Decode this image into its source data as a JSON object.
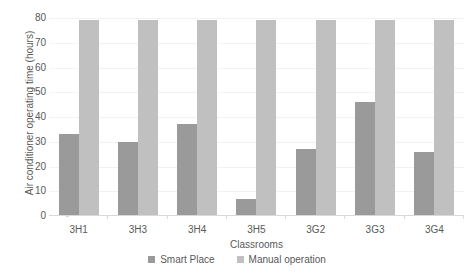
{
  "chart_data": {
    "type": "bar",
    "title": "",
    "xlabel": "Classrooms",
    "ylabel": "Air conditioner operating time (hours)",
    "categories": [
      "3H1",
      "3H3",
      "3H4",
      "3H5",
      "3G2",
      "3G3",
      "3G4"
    ],
    "series": [
      {
        "name": "Smart Place",
        "color": "#9a9a9a",
        "values": [
          33,
          30,
          37,
          7,
          27,
          46,
          26
        ]
      },
      {
        "name": "Manual operation",
        "color": "#c0c0c0",
        "values": [
          79,
          79,
          79,
          79,
          79,
          79,
          79
        ]
      }
    ],
    "ylim": [
      0,
      80
    ],
    "yticks": [
      0,
      10,
      20,
      30,
      40,
      50,
      60,
      70,
      80
    ],
    "ytick_labels": [
      "0",
      "10",
      "20",
      "30",
      "40",
      "50",
      "60",
      "70",
      "80"
    ],
    "grid": true,
    "legend_position": "bottom"
  },
  "colors": {
    "smart_place": "#9a9a9a",
    "manual_operation": "#c0c0c0",
    "gridline": "#f2f2f2",
    "axis": "#d9d9d9",
    "text": "#595959",
    "background": "#ffffff"
  }
}
